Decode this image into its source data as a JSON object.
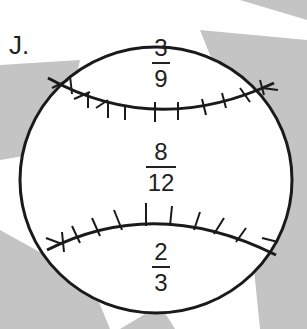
{
  "problem": {
    "label": "J.",
    "fractions": [
      {
        "numerator": "3",
        "denominator": "9"
      },
      {
        "numerator": "8",
        "denominator": "12"
      },
      {
        "numerator": "2",
        "denominator": "3"
      }
    ]
  },
  "colors": {
    "ray": "#bdbdbd",
    "ball_fill": "#ffffff",
    "stroke": "#1a1a1a"
  }
}
